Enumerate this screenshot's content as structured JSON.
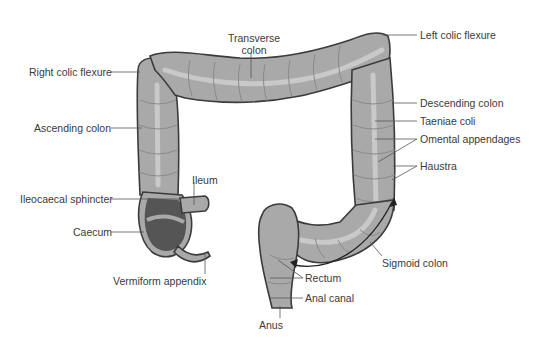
{
  "diagram": {
    "colors": {
      "organ_fill": "#a9a9a9",
      "organ_outline": "#3b3b3b",
      "taeniae_band": "#c9c9c9",
      "caecum_interior": "#555555",
      "label_text": "#3a3a3a",
      "background": "#ffffff"
    },
    "labels": {
      "transverse_colon_line1": "Transverse",
      "transverse_colon_line2": "colon",
      "left_colic_flexure": "Left colic flexure",
      "right_colic_flexure": "Right colic flexure",
      "ascending_colon": "Ascending colon",
      "descending_colon": "Descending colon",
      "taeniae_coli": "Taeniae coli",
      "omental_appendages": "Omental appendages",
      "haustra": "Haustra",
      "ileum": "Ileum",
      "ileocaecal_sphincter": "Ileocaecal sphincter",
      "caecum": "Caecum",
      "vermiform_appendix": "Vermiform appendix",
      "sigmoid_colon": "Sigmoid colon",
      "rectum": "Rectum",
      "anal_canal": "Anal canal",
      "anus": "Anus"
    }
  }
}
